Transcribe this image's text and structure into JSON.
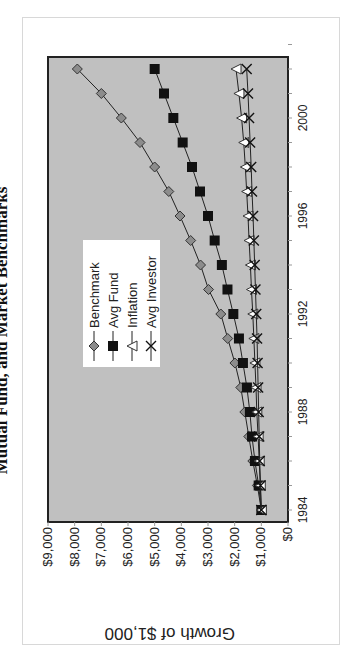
{
  "chart_data": {
    "type": "line",
    "title": "Mutual Fund, and Market Benchmarks",
    "ylabel": "Growth of $1,000",
    "xlabel": "",
    "ylim": [
      0,
      9000
    ],
    "y_ticks": [
      "$0",
      "$1,000",
      "$2,000",
      "$3,000",
      "$4,000",
      "$5,000",
      "$6,000",
      "$7,000",
      "$8,000",
      "$9,000"
    ],
    "x_ticks": [
      "1984",
      "1988",
      "1992",
      "1996",
      "2000"
    ],
    "x": [
      1984,
      1985,
      1986,
      1987,
      1988,
      1989,
      1990,
      1991,
      1992,
      1993,
      1994,
      1995,
      1996,
      1997,
      1998,
      1999,
      2000,
      2001,
      2002
    ],
    "legend_position": "upper-left inside plot",
    "grid": false,
    "plot_background": "#c0c0c0",
    "series": [
      {
        "name": "Benchmark",
        "marker": "diamond",
        "color": "#8c8c8c",
        "values": [
          1000,
          1150,
          1320,
          1470,
          1620,
          1770,
          1990,
          2260,
          2520,
          2980,
          3280,
          3650,
          4050,
          4470,
          5000,
          5550,
          6250,
          7000,
          7900
        ]
      },
      {
        "name": "Avg Fund",
        "marker": "square",
        "color": "#111111",
        "values": [
          1000,
          1100,
          1240,
          1350,
          1430,
          1540,
          1690,
          1840,
          2050,
          2270,
          2480,
          2750,
          3000,
          3300,
          3600,
          3950,
          4300,
          4650,
          5000
        ]
      },
      {
        "name": "Inflation",
        "marker": "triangle",
        "color": "#ffffff",
        "values": [
          1000,
          1040,
          1080,
          1120,
          1170,
          1200,
          1240,
          1280,
          1320,
          1370,
          1410,
          1460,
          1500,
          1550,
          1600,
          1660,
          1740,
          1840,
          1950
        ]
      },
      {
        "name": "Avg Investor",
        "marker": "x",
        "color": "#111111",
        "values": [
          1000,
          1030,
          1060,
          1080,
          1100,
          1120,
          1140,
          1160,
          1190,
          1220,
          1250,
          1280,
          1310,
          1350,
          1380,
          1420,
          1460,
          1500,
          1550
        ]
      }
    ]
  }
}
